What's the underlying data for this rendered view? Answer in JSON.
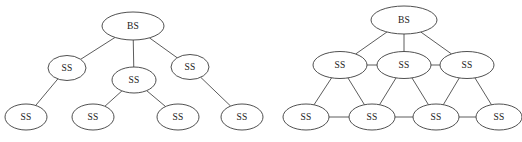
{
  "figure": {
    "width": 522,
    "height": 142,
    "background_color": "#ffffff",
    "node_fill_color": "#ffffff",
    "node_stroke_color": "#3c3c3c",
    "edge_color": "#4a4a4a",
    "label_color": "#1a1a1a"
  },
  "diagrams": [
    {
      "id": "left-tree-topology",
      "name": "tree-topology",
      "nodes": [
        {
          "id": "L-BS",
          "label": "BS",
          "cx": 133,
          "cy": 26,
          "rx": 31,
          "ry": 14
        },
        {
          "id": "L-S1",
          "label": "SS",
          "cx": 67,
          "cy": 68,
          "rx": 19,
          "ry": 12.5
        },
        {
          "id": "L-S2",
          "label": "SS",
          "cx": 134,
          "cy": 80,
          "rx": 22,
          "ry": 13
        },
        {
          "id": "L-S3",
          "label": "SS",
          "cx": 190,
          "cy": 67,
          "rx": 19,
          "ry": 12.5
        },
        {
          "id": "L-S4",
          "label": "SS",
          "cx": 26,
          "cy": 117,
          "rx": 21,
          "ry": 13
        },
        {
          "id": "L-S5",
          "label": "SS",
          "cx": 93,
          "cy": 117,
          "rx": 21,
          "ry": 13
        },
        {
          "id": "L-S6",
          "label": "SS",
          "cx": 178,
          "cy": 117,
          "rx": 21,
          "ry": 13
        },
        {
          "id": "L-S7",
          "label": "SS",
          "cx": 242,
          "cy": 117,
          "rx": 21,
          "ry": 13
        }
      ],
      "edges": [
        {
          "from": "L-BS",
          "to": "L-S1"
        },
        {
          "from": "L-BS",
          "to": "L-S2"
        },
        {
          "from": "L-BS",
          "to": "L-S3"
        },
        {
          "from": "L-S1",
          "to": "L-S4"
        },
        {
          "from": "L-S2",
          "to": "L-S5"
        },
        {
          "from": "L-S2",
          "to": "L-S6"
        },
        {
          "from": "L-S3",
          "to": "L-S7"
        }
      ]
    },
    {
      "id": "right-mesh-topology",
      "name": "mesh-topology",
      "nodes": [
        {
          "id": "R-BS",
          "label": "BS",
          "cx": 404,
          "cy": 20,
          "rx": 33,
          "ry": 14
        },
        {
          "id": "R-S1",
          "label": "SS",
          "cx": 340,
          "cy": 65,
          "rx": 27,
          "ry": 13.5
        },
        {
          "id": "R-S2",
          "label": "SS",
          "cx": 404,
          "cy": 65,
          "rx": 27,
          "ry": 13.5
        },
        {
          "id": "R-S3",
          "label": "SS",
          "cx": 467,
          "cy": 65,
          "rx": 27,
          "ry": 13.5
        },
        {
          "id": "R-S4",
          "label": "SS",
          "cx": 306,
          "cy": 117,
          "rx": 23,
          "ry": 13
        },
        {
          "id": "R-S5",
          "label": "SS",
          "cx": 372,
          "cy": 117,
          "rx": 23,
          "ry": 13
        },
        {
          "id": "R-S6",
          "label": "SS",
          "cx": 436,
          "cy": 117,
          "rx": 23,
          "ry": 13
        },
        {
          "id": "R-S7",
          "label": "SS",
          "cx": 499,
          "cy": 117,
          "rx": 23,
          "ry": 13
        }
      ],
      "edges": [
        {
          "from": "R-BS",
          "to": "R-S1"
        },
        {
          "from": "R-BS",
          "to": "R-S2"
        },
        {
          "from": "R-BS",
          "to": "R-S3"
        },
        {
          "from": "R-S1",
          "to": "R-S2"
        },
        {
          "from": "R-S2",
          "to": "R-S3"
        },
        {
          "from": "R-S1",
          "to": "R-S4"
        },
        {
          "from": "R-S1",
          "to": "R-S5"
        },
        {
          "from": "R-S2",
          "to": "R-S5"
        },
        {
          "from": "R-S2",
          "to": "R-S6"
        },
        {
          "from": "R-S3",
          "to": "R-S6"
        },
        {
          "from": "R-S3",
          "to": "R-S7"
        },
        {
          "from": "R-S4",
          "to": "R-S5"
        },
        {
          "from": "R-S5",
          "to": "R-S6"
        },
        {
          "from": "R-S6",
          "to": "R-S7"
        }
      ]
    }
  ]
}
